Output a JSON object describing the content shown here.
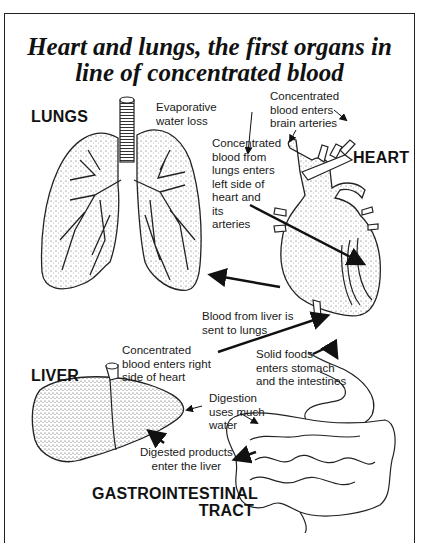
{
  "title": {
    "line1": "Heart and lungs, the first organs in",
    "line2": "line of concentrated blood"
  },
  "organs": {
    "lungs": "LUNGS",
    "heart": "HEART",
    "liver": "LIVER",
    "gi_line1": "GASTROINTESTINAL",
    "gi_line2": "TRACT"
  },
  "annotations": {
    "evaporative": "Evaporative\nwater loss",
    "brain_arteries": "Concentrated\nblood enters\nbrain arteries",
    "left_side": "Concentrated\nblood from\nlungs enters\nleft side of\nheart and\nits\narteries",
    "liver_to_lungs": "Blood from liver is\nsent to lungs",
    "right_side": "Concentrated\nblood enters right\nside of heart",
    "solid_foods": "Solid foods\nenters stomach\nand the intestines",
    "digestion": "Digestion\nuses much\nwater",
    "digested_products": "Digested products\nenter the liver"
  },
  "colors": {
    "ink": "#1a1a1a",
    "stipple": "#bdbdbd",
    "background": "#ffffff"
  }
}
